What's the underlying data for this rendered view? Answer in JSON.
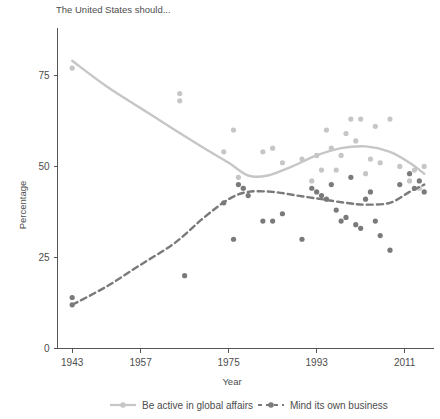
{
  "chart_data": {
    "type": "scatter",
    "title": "The United States should...",
    "xlabel": "Year",
    "ylabel": "Percentage",
    "xlim": [
      1940,
      2017
    ],
    "ylim": [
      0,
      88
    ],
    "xticks": [
      1943,
      1957,
      1975,
      1993,
      2011
    ],
    "xtick_labels": [
      "1943",
      "1957",
      "1975",
      "1993",
      "2011"
    ],
    "yticks": [
      0,
      25,
      50,
      75
    ],
    "ytick_labels": [
      "0",
      "25",
      "50",
      "75"
    ],
    "grid": false,
    "legend_position": "bottom",
    "colors": {
      "active_series": "#c6c6c6",
      "business_series": "#7a7a7a",
      "axis": "#555555",
      "text": "#4d4d4d",
      "background": "#ffffff"
    },
    "series": [
      {
        "name": "Be active in global affairs",
        "marker": "circle",
        "line_style": "solid",
        "color": "#c6c6c6",
        "points": [
          {
            "x": 1943,
            "y": 77
          },
          {
            "x": 1965,
            "y": 70
          },
          {
            "x": 1965,
            "y": 68
          },
          {
            "x": 1974,
            "y": 54
          },
          {
            "x": 1976,
            "y": 60
          },
          {
            "x": 1977,
            "y": 47
          },
          {
            "x": 1978,
            "y": 44
          },
          {
            "x": 1982,
            "y": 54
          },
          {
            "x": 1984,
            "y": 55
          },
          {
            "x": 1986,
            "y": 51
          },
          {
            "x": 1990,
            "y": 52
          },
          {
            "x": 1992,
            "y": 46
          },
          {
            "x": 1993,
            "y": 53
          },
          {
            "x": 1994,
            "y": 49
          },
          {
            "x": 1995,
            "y": 60
          },
          {
            "x": 1996,
            "y": 55
          },
          {
            "x": 1997,
            "y": 49
          },
          {
            "x": 1998,
            "y": 53
          },
          {
            "x": 1999,
            "y": 59
          },
          {
            "x": 2000,
            "y": 63
          },
          {
            "x": 2001,
            "y": 57
          },
          {
            "x": 2002,
            "y": 63
          },
          {
            "x": 2003,
            "y": 48
          },
          {
            "x": 2004,
            "y": 52
          },
          {
            "x": 2005,
            "y": 61
          },
          {
            "x": 2006,
            "y": 51
          },
          {
            "x": 2008,
            "y": 63
          },
          {
            "x": 2010,
            "y": 50
          },
          {
            "x": 2012,
            "y": 46
          },
          {
            "x": 2013,
            "y": 49
          },
          {
            "x": 2014,
            "y": 44
          },
          {
            "x": 2015,
            "y": 50
          }
        ],
        "trend": [
          {
            "x": 1943,
            "y": 79
          },
          {
            "x": 1950,
            "y": 72
          },
          {
            "x": 1957,
            "y": 66
          },
          {
            "x": 1964,
            "y": 60
          },
          {
            "x": 1970,
            "y": 55
          },
          {
            "x": 1975,
            "y": 51
          },
          {
            "x": 1979,
            "y": 47.5
          },
          {
            "x": 1983,
            "y": 47.5
          },
          {
            "x": 1988,
            "y": 50
          },
          {
            "x": 1993,
            "y": 53
          },
          {
            "x": 1998,
            "y": 55
          },
          {
            "x": 2003,
            "y": 55.5
          },
          {
            "x": 2008,
            "y": 54
          },
          {
            "x": 2012,
            "y": 51
          },
          {
            "x": 2015,
            "y": 48
          }
        ]
      },
      {
        "name": "Mind its own business",
        "marker": "circle",
        "line_style": "dashed",
        "color": "#7a7a7a",
        "points": [
          {
            "x": 1943,
            "y": 14
          },
          {
            "x": 1943,
            "y": 12
          },
          {
            "x": 1966,
            "y": 20
          },
          {
            "x": 1974,
            "y": 40
          },
          {
            "x": 1976,
            "y": 30
          },
          {
            "x": 1977,
            "y": 45
          },
          {
            "x": 1978,
            "y": 44
          },
          {
            "x": 1979,
            "y": 42
          },
          {
            "x": 1982,
            "y": 35
          },
          {
            "x": 1984,
            "y": 35
          },
          {
            "x": 1986,
            "y": 37
          },
          {
            "x": 1990,
            "y": 30
          },
          {
            "x": 1992,
            "y": 44
          },
          {
            "x": 1993,
            "y": 43
          },
          {
            "x": 1994,
            "y": 42
          },
          {
            "x": 1995,
            "y": 41
          },
          {
            "x": 1996,
            "y": 45
          },
          {
            "x": 1997,
            "y": 38
          },
          {
            "x": 1998,
            "y": 35
          },
          {
            "x": 1999,
            "y": 36
          },
          {
            "x": 2000,
            "y": 47
          },
          {
            "x": 2001,
            "y": 34
          },
          {
            "x": 2002,
            "y": 33
          },
          {
            "x": 2003,
            "y": 41
          },
          {
            "x": 2004,
            "y": 43
          },
          {
            "x": 2005,
            "y": 35
          },
          {
            "x": 2006,
            "y": 31
          },
          {
            "x": 2008,
            "y": 27
          },
          {
            "x": 2010,
            "y": 45
          },
          {
            "x": 2012,
            "y": 48
          },
          {
            "x": 2013,
            "y": 44
          },
          {
            "x": 2014,
            "y": 46
          },
          {
            "x": 2015,
            "y": 43
          }
        ],
        "trend": [
          {
            "x": 1943,
            "y": 12
          },
          {
            "x": 1950,
            "y": 17
          },
          {
            "x": 1957,
            "y": 23
          },
          {
            "x": 1964,
            "y": 29
          },
          {
            "x": 1970,
            "y": 36
          },
          {
            "x": 1975,
            "y": 41
          },
          {
            "x": 1979,
            "y": 43
          },
          {
            "x": 1984,
            "y": 43
          },
          {
            "x": 1989,
            "y": 42
          },
          {
            "x": 1994,
            "y": 41
          },
          {
            "x": 1999,
            "y": 40
          },
          {
            "x": 2003,
            "y": 39.5
          },
          {
            "x": 2008,
            "y": 40
          },
          {
            "x": 2012,
            "y": 43
          },
          {
            "x": 2015,
            "y": 45
          }
        ]
      }
    ],
    "legend": [
      {
        "label": "Be active in global affairs",
        "color": "#c6c6c6",
        "style": "solid"
      },
      {
        "label": "Mind its own business",
        "color": "#7a7a7a",
        "style": "dashed"
      }
    ]
  }
}
